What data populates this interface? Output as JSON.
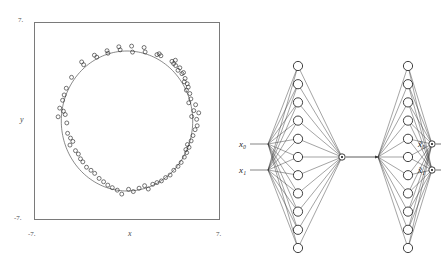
{
  "figure": {
    "kind": "two-panel-figure",
    "panels": [
      "scatter-plot",
      "autoencoder-network-diagram"
    ]
  },
  "scatter": {
    "axis": {
      "y_top_label": "7.",
      "y_bottom_label": "-7.",
      "x_left_label": "-7.",
      "x_right_label": "7.",
      "x_name": "x",
      "y_name": "y"
    },
    "frame_color": "#7a7a7a",
    "point_color": "#2b2b2b",
    "curve_color": "#555555"
  },
  "network": {
    "input_labels": [
      "x₀",
      "x₁"
    ],
    "output_labels": [
      "x̃₀",
      "x̃₁"
    ],
    "encoder": {
      "inputs": 2,
      "hidden": 11,
      "bottleneck": 1
    },
    "decoder": {
      "bottleneck": 1,
      "hidden": 11,
      "outputs": 2
    },
    "node_fill": "#ffffff",
    "node_stroke": "#111111",
    "edge_color": "#333333"
  },
  "chart_data": {
    "type": "scatter",
    "title": "",
    "xlabel": "x",
    "ylabel": "y",
    "xlim": [
      -7,
      7
    ],
    "ylim": [
      -7,
      7
    ],
    "xticks": [
      -7,
      7
    ],
    "yticks": [
      -7,
      7
    ],
    "grid": false,
    "legend": null,
    "series": [
      {
        "name": "samples",
        "marker": "open-circle",
        "points": [
          [
            0.42,
            4.92
          ],
          [
            0.35,
            5.35
          ],
          [
            1.38,
            4.93
          ],
          [
            1.3,
            5.25
          ],
          [
            2.28,
            4.74
          ],
          [
            2.45,
            4.8
          ],
          [
            2.58,
            4.66
          ],
          [
            -0.52,
            5.08
          ],
          [
            -0.62,
            5.3
          ],
          [
            -1.45,
            4.84
          ],
          [
            -1.52,
            5.02
          ],
          [
            -2.3,
            4.56
          ],
          [
            -2.48,
            4.7
          ],
          [
            -3.3,
            4.02
          ],
          [
            -3.45,
            4.22
          ],
          [
            -4.22,
            3.12
          ],
          [
            3.42,
            4.26
          ],
          [
            3.55,
            4.1
          ],
          [
            3.68,
            4.34
          ],
          [
            3.7,
            3.96
          ],
          [
            3.88,
            3.62
          ],
          [
            4.02,
            3.8
          ],
          [
            4.18,
            3.38
          ],
          [
            4.3,
            3.46
          ],
          [
            4.42,
            3.04
          ],
          [
            4.36,
            2.8
          ],
          [
            4.58,
            2.66
          ],
          [
            4.66,
            2.42
          ],
          [
            4.52,
            2.2
          ],
          [
            4.78,
            1.96
          ],
          [
            4.86,
            1.58
          ],
          [
            4.7,
            1.3
          ],
          [
            5.22,
            1.16
          ],
          [
            5.08,
            0.74
          ],
          [
            4.92,
            0.32
          ],
          [
            5.3,
            0.12
          ],
          [
            -4.62,
            2.34
          ],
          [
            -4.78,
            1.86
          ],
          [
            -4.9,
            1.48
          ],
          [
            -5.12,
            0.92
          ],
          [
            -4.84,
            0.7
          ],
          [
            -4.7,
            0.46
          ],
          [
            -5.24,
            0.3
          ],
          [
            -4.58,
            -0.14
          ],
          [
            -4.52,
            -0.88
          ],
          [
            -4.3,
            -1.22
          ],
          [
            -4.12,
            -1.46
          ],
          [
            -4.34,
            -1.72
          ],
          [
            -3.92,
            -2.12
          ],
          [
            -3.7,
            -2.36
          ],
          [
            -3.54,
            -2.7
          ],
          [
            -3.36,
            -2.92
          ],
          [
            -3.08,
            -3.3
          ],
          [
            -2.74,
            -3.52
          ],
          [
            -2.46,
            -3.74
          ],
          [
            -2.12,
            -4.1
          ],
          [
            -1.78,
            -4.34
          ],
          [
            -1.46,
            -4.58
          ],
          [
            -1.12,
            -4.76
          ],
          [
            -0.74,
            -4.94
          ],
          [
            -0.4,
            -5.22
          ],
          [
            0.12,
            -4.88
          ],
          [
            0.48,
            -5.04
          ],
          [
            0.92,
            -4.8
          ],
          [
            1.34,
            -4.62
          ],
          [
            1.62,
            -4.86
          ],
          [
            1.96,
            -4.52
          ],
          [
            2.28,
            -4.4
          ],
          [
            2.62,
            -4.28
          ],
          [
            2.94,
            -4.04
          ],
          [
            3.28,
            -3.86
          ],
          [
            3.56,
            -3.52
          ],
          [
            3.88,
            -3.24
          ],
          [
            4.12,
            -2.96
          ],
          [
            4.36,
            -2.58
          ],
          [
            4.54,
            -2.26
          ],
          [
            4.72,
            -1.88
          ],
          [
            4.88,
            -1.42
          ],
          [
            5.02,
            -1.04
          ],
          [
            5.18,
            -0.62
          ],
          [
            5.34,
            -0.34
          ],
          [
            4.6,
            -1.68
          ],
          [
            4.48,
            -2.04
          ],
          [
            5.46,
            0.58
          ]
        ]
      },
      {
        "name": "fitted-circle",
        "marker": "line",
        "center": [
          0.0,
          0.0
        ],
        "radius": 5.0
      }
    ]
  }
}
